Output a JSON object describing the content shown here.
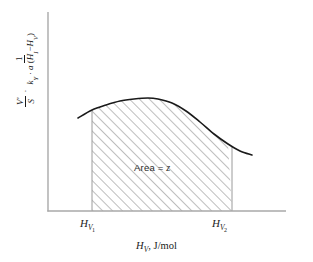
{
  "chart_data": {
    "type": "area",
    "title": "",
    "subtitle": "",
    "xlabel_text": "H",
    "xlabel_sub": "V",
    "xlabel_units": ", J/mol",
    "ylabel_parts": {
      "frac1_num": "V'",
      "frac1_den": "S",
      "operator": "·",
      "frac2_num": "1",
      "frac2_den_k": "k",
      "frac2_den_k_sub": "Y",
      "frac2_den_dot": "·",
      "frac2_den_a": "a",
      "frac2_den_paren_open": "(",
      "frac2_den_H1": "H",
      "frac2_den_H1_sub": "I",
      "frac2_den_minus": "−",
      "frac2_den_H2": "H",
      "frac2_den_H2_sub": "V",
      "frac2_den_paren_close": ")"
    },
    "xticks": [
      {
        "label_base": "H",
        "label_sub": "V",
        "label_sub2": "1",
        "x_value": 92
      },
      {
        "label_base": "H",
        "label_sub": "V",
        "label_sub2": "2",
        "x_value": 232
      }
    ],
    "annotations": [
      {
        "text_prefix": "Area = ",
        "text_value": "z",
        "x": 160,
        "y": 168
      }
    ],
    "curve_points": [
      {
        "x": 78,
        "y": 118
      },
      {
        "x": 92,
        "y": 110
      },
      {
        "x": 106,
        "y": 105
      },
      {
        "x": 120,
        "y": 101
      },
      {
        "x": 134,
        "y": 99
      },
      {
        "x": 148,
        "y": 98
      },
      {
        "x": 158,
        "y": 99
      },
      {
        "x": 172,
        "y": 103
      },
      {
        "x": 186,
        "y": 111
      },
      {
        "x": 200,
        "y": 122
      },
      {
        "x": 214,
        "y": 134
      },
      {
        "x": 228,
        "y": 144
      },
      {
        "x": 240,
        "y": 151
      },
      {
        "x": 252,
        "y": 155
      }
    ],
    "shaded_region": {
      "x_start": 92,
      "x_end": 232,
      "baseline_y": 211,
      "fill": "hatch-45",
      "hatch_color": "#6e6e6e",
      "hatch_spacing_px": 7
    },
    "axes": {
      "x_axis": {
        "x_start": 48,
        "x_end": 286,
        "y": 211,
        "color": "#a9a9a9"
      },
      "y_axis": {
        "y_start": 12,
        "y_end": 211,
        "x": 48,
        "color": "#a9a9a9"
      },
      "grid": false,
      "ticks_visible": false
    },
    "curve_color": "#1a1a1a",
    "curve_width_px": 1.6,
    "background": "#ffffff",
    "legend": null
  }
}
